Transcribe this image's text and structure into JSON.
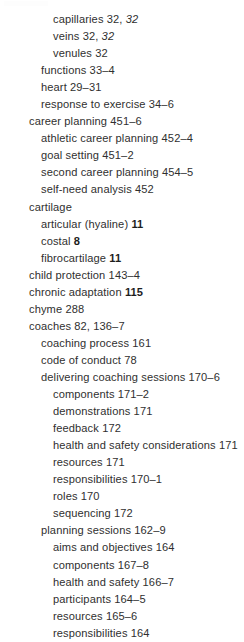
{
  "document": {
    "type": "book-index",
    "background_color": "#ffffff",
    "text_color": "#2f2f2f",
    "entries": [
      {
        "level": 3,
        "term": "capillaries",
        "pages": "32, ",
        "pages_italic": "32"
      },
      {
        "level": 3,
        "term": "veins",
        "pages": "32, ",
        "pages_italic": "32"
      },
      {
        "level": 3,
        "term": "venules",
        "pages": "32"
      },
      {
        "level": 2,
        "term": "functions",
        "pages": "33–4"
      },
      {
        "level": 2,
        "term": "heart",
        "pages": "29–31"
      },
      {
        "level": 2,
        "term": "response to exercise",
        "pages": "34–6"
      },
      {
        "level": 1,
        "term": "career planning",
        "pages": "451–6"
      },
      {
        "level": 2,
        "term": "athletic career planning",
        "pages": "452–4"
      },
      {
        "level": 2,
        "term": "goal setting",
        "pages": "451–2"
      },
      {
        "level": 2,
        "term": "second career planning",
        "pages": "454–5"
      },
      {
        "level": 2,
        "term": "self-need analysis",
        "pages": "452"
      },
      {
        "level": 1,
        "term": "cartilage",
        "pages": ""
      },
      {
        "level": 2,
        "term": "articular (hyaline)",
        "pages_bold": "11"
      },
      {
        "level": 2,
        "term": "costal",
        "pages_bold": "8"
      },
      {
        "level": 2,
        "term": "fibrocartilage",
        "pages_bold": "11"
      },
      {
        "level": 1,
        "term": "child protection",
        "pages": "143–4"
      },
      {
        "level": 1,
        "term": "chronic adaptation",
        "pages_bold": "115"
      },
      {
        "level": 1,
        "term": "chyme",
        "pages": "288"
      },
      {
        "level": 1,
        "term": "coaches",
        "pages": "82, 136–7"
      },
      {
        "level": 2,
        "term": "coaching process",
        "pages": "161"
      },
      {
        "level": 2,
        "term": "code of conduct",
        "pages": "78"
      },
      {
        "level": 2,
        "term": "delivering coaching sessions",
        "pages": "170–6"
      },
      {
        "level": 3,
        "term": "components",
        "pages": "171–2"
      },
      {
        "level": 3,
        "term": "demonstrations",
        "pages": "171"
      },
      {
        "level": 3,
        "term": "feedback",
        "pages": "172"
      },
      {
        "level": 3,
        "term": "health and safety considerations",
        "pages": "171"
      },
      {
        "level": 3,
        "term": "resources",
        "pages": "171"
      },
      {
        "level": 3,
        "term": "responsibilities",
        "pages": "170–1"
      },
      {
        "level": 3,
        "term": "roles",
        "pages": "170"
      },
      {
        "level": 3,
        "term": "sequencing",
        "pages": "172"
      },
      {
        "level": 2,
        "term": "planning sessions",
        "pages": "162–9"
      },
      {
        "level": 3,
        "term": "aims and objectives",
        "pages": "164"
      },
      {
        "level": 3,
        "term": "components",
        "pages": "167–8"
      },
      {
        "level": 3,
        "term": "health and safety",
        "pages": "166–7"
      },
      {
        "level": 3,
        "term": "participants",
        "pages": "164–5"
      },
      {
        "level": 3,
        "term": "resources",
        "pages": "165–6"
      },
      {
        "level": 3,
        "term": "responsibilities",
        "pages": "164"
      }
    ]
  }
}
